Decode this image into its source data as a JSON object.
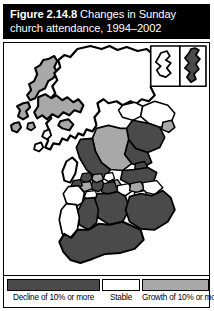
{
  "figure": {
    "number_label": "Figure 2.14.8",
    "title_rest": " Changes in Sunday",
    "title_line2": "church attendance, 1994–2002"
  },
  "legend": {
    "items": [
      {
        "label": "Decline of 10% or more",
        "color": "#4a4a4a",
        "category": "decline"
      },
      {
        "label": "Stable",
        "color": "#ffffff",
        "category": "stable"
      },
      {
        "label": "Growth of 10% or more",
        "color": "#a8a8a8",
        "category": "growth"
      }
    ]
  },
  "map": {
    "region": "Scotland",
    "inset": {
      "orkney": {
        "name": "Orkney Islands",
        "category": "stable"
      },
      "shetland": {
        "name": "Shetland Islands",
        "category": "decline"
      }
    },
    "areas": [
      {
        "name": "Western Isles",
        "category": "growth"
      },
      {
        "name": "Highland",
        "category": "stable"
      },
      {
        "name": "Argyll and Bute",
        "category": "growth"
      },
      {
        "name": "Moray",
        "category": "stable"
      },
      {
        "name": "Aberdeenshire",
        "category": "decline"
      },
      {
        "name": "Aberdeen City",
        "category": "growth"
      },
      {
        "name": "Angus",
        "category": "decline"
      },
      {
        "name": "Perth and Kinross",
        "category": "growth"
      },
      {
        "name": "Dundee City",
        "category": "decline"
      },
      {
        "name": "Stirling",
        "category": "decline"
      },
      {
        "name": "Fife",
        "category": "decline"
      },
      {
        "name": "Clackmannanshire",
        "category": "stable"
      },
      {
        "name": "Falkirk",
        "category": "growth"
      },
      {
        "name": "West Lothian",
        "category": "stable"
      },
      {
        "name": "City of Edinburgh",
        "category": "growth"
      },
      {
        "name": "East Lothian",
        "category": "stable"
      },
      {
        "name": "Midlothian",
        "category": "stable"
      },
      {
        "name": "Scottish Borders",
        "category": "decline"
      },
      {
        "name": "Glasgow City",
        "category": "decline"
      },
      {
        "name": "North Lanarkshire",
        "category": "decline"
      },
      {
        "name": "South Lanarkshire",
        "category": "decline"
      },
      {
        "name": "East Dunbartonshire",
        "category": "growth"
      },
      {
        "name": "West Dunbartonshire",
        "category": "decline"
      },
      {
        "name": "Renfrewshire",
        "category": "growth"
      },
      {
        "name": "Inverclyde",
        "category": "decline"
      },
      {
        "name": "East Renfrewshire",
        "category": "stable"
      },
      {
        "name": "North Ayrshire",
        "category": "stable"
      },
      {
        "name": "East Ayrshire",
        "category": "decline"
      },
      {
        "name": "South Ayrshire",
        "category": "decline"
      },
      {
        "name": "Dumfries and Galloway",
        "category": "decline"
      }
    ]
  },
  "colors": {
    "decline": "#4a4a4a",
    "stable": "#ffffff",
    "growth": "#a8a8a8",
    "outline": "#000000",
    "title_bg": "#000000",
    "title_fg": "#ffffff"
  }
}
